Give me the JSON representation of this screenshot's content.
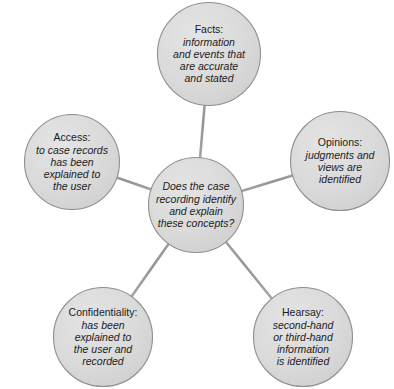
{
  "diagram": {
    "type": "radial-hub-and-spoke",
    "background_color": "#ffffff",
    "node_fill_color": "#d9d9d9",
    "node_stroke_color": "#8c8c8c",
    "connector_color": "#9a9a9a",
    "text_color": "#1b1b1b",
    "hub": {
      "name": "case-recording-question",
      "lines": [
        "Does the case",
        "recording identify",
        "and explain",
        "these concepts?"
      ]
    },
    "nodes": [
      {
        "name": "facts",
        "title": "Facts:",
        "desc_lines": [
          "information",
          "and events that",
          "are accurate",
          "and stated"
        ]
      },
      {
        "name": "opinions",
        "title": "Opinions:",
        "desc_lines": [
          "judgments and",
          "views are",
          "identified"
        ]
      },
      {
        "name": "access",
        "title": "Access:",
        "desc_lines": [
          "to case records",
          "has been",
          "explained to",
          "the user"
        ]
      },
      {
        "name": "confidentiality",
        "title": "Confidentiality:",
        "desc_lines": [
          "has been",
          "explained to",
          "the user and",
          "recorded"
        ]
      },
      {
        "name": "hearsay",
        "title": "Hearsay:",
        "desc_lines": [
          "second-hand",
          "or third-hand",
          "information",
          "is identified"
        ]
      }
    ]
  }
}
